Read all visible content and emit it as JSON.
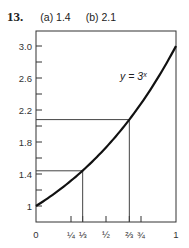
{
  "problem": {
    "number": "13.",
    "part_a": "(a) 1.4",
    "part_b": "(b) 2.1"
  },
  "chart_data": {
    "type": "line",
    "title": "",
    "curve_label": "y = 3ˣ",
    "function": "y = 3^x",
    "x": [
      0,
      0.1,
      0.2,
      0.25,
      0.3333,
      0.4,
      0.5,
      0.6,
      0.6667,
      0.75,
      0.8,
      0.9,
      1.0
    ],
    "y": [
      1.0,
      1.116,
      1.246,
      1.316,
      1.442,
      1.552,
      1.732,
      1.933,
      2.08,
      2.28,
      2.408,
      2.688,
      3.0
    ],
    "xlim": [
      0,
      1
    ],
    "ylim": [
      0.9,
      3.2
    ],
    "x_ticks": [
      "0",
      "¼",
      "⅓",
      "½",
      "⅔",
      "¾",
      "1"
    ],
    "x_tick_values": [
      0,
      0.25,
      0.3333,
      0.5,
      0.6667,
      0.75,
      1
    ],
    "y_tick_labels": [
      "1",
      "1.4",
      "1.8",
      "2.2",
      "2.6",
      "3.0"
    ],
    "y_tick_values": [
      1,
      1.4,
      1.8,
      2.2,
      2.6,
      3.0
    ],
    "y_minor_ticks": [
      1.2,
      1.6,
      2.0,
      2.4,
      2.8
    ],
    "annotations": [
      {
        "x": 0.3333,
        "y": 1.44,
        "label": "3^(1/3) ≈ 1.4"
      },
      {
        "x": 0.6667,
        "y": 2.08,
        "label": "3^(2/3) ≈ 2.1"
      }
    ],
    "xlabel": "",
    "ylabel": "",
    "grid": false
  }
}
